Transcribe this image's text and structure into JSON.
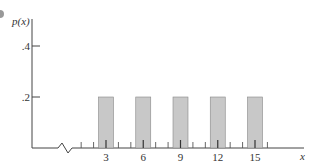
{
  "chart_data": {
    "type": "bar",
    "title": "",
    "xlabel": "x",
    "ylabel": "p(x)",
    "categories": [
      "3",
      "6",
      "9",
      "12",
      "15"
    ],
    "x": [
      3,
      6,
      9,
      12,
      15
    ],
    "values": [
      0.2,
      0.2,
      0.2,
      0.2,
      0.2
    ],
    "yticks": [
      ".2",
      ".4"
    ],
    "ytick_values": [
      0.2,
      0.4
    ],
    "xticks_labeled": [
      "3",
      "6",
      "9",
      "12",
      "15"
    ],
    "xlim": [
      0,
      16
    ],
    "ylim": [
      0,
      0.5
    ],
    "grid": false,
    "axis_break": true,
    "bar_color": "#c8c8c8",
    "bar_edge_color": "#888888"
  }
}
